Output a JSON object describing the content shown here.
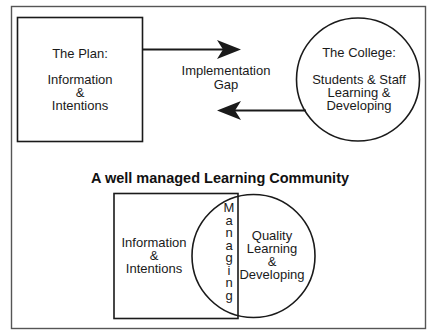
{
  "diagram": {
    "top": {
      "plan_box": {
        "heading": "The Plan:",
        "lines": [
          "Information",
          "&",
          "Intentions"
        ]
      },
      "gap_label": {
        "lines": [
          "Implementation",
          "Gap"
        ]
      },
      "college_circle": {
        "heading": "The College:",
        "lines": [
          "Students & Staff",
          "Learning &",
          "Developing"
        ]
      }
    },
    "title": "A well managed Learning Community",
    "bottom": {
      "box": {
        "lines": [
          "Information",
          "&",
          "Intentions"
        ]
      },
      "overlap_vertical": {
        "word": "Managing",
        "letters": [
          "M",
          "a",
          "n",
          "a",
          "g",
          "i",
          "n",
          "g"
        ]
      },
      "circle": {
        "lines": [
          "Quality",
          "Learning",
          "&",
          "Developing"
        ]
      }
    },
    "colors": {
      "line": "#1a1a1a",
      "background": "#ffffff",
      "frame": "#555555"
    }
  }
}
